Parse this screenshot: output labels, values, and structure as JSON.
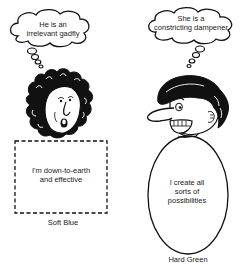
{
  "figure": {
    "left_character": {
      "thought": [
        "He is an",
        "irrelevant gadfly"
      ],
      "body_text": [
        "I'm down-to-earth",
        "and effective"
      ],
      "caption": "Soft Blue",
      "body_shape": "dashed-rectangle"
    },
    "right_character": {
      "thought": [
        "She is a",
        "constricting dampener"
      ],
      "body_text": [
        "I create all",
        "sorts of",
        "possibilities"
      ],
      "caption": "Hard Green",
      "body_shape": "oval"
    },
    "colors": {
      "ink": "#111111",
      "background": "#ffffff"
    }
  }
}
